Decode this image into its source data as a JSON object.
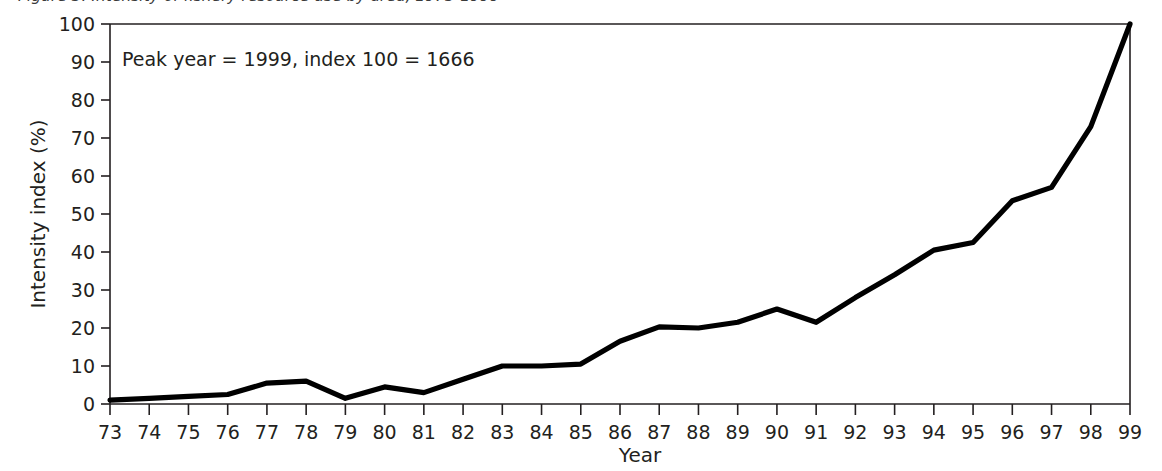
{
  "figure": {
    "caption_fragment": "Figure 3. Intensity of fishery resource use by area, 1973-1999",
    "background_color": "#ffffff",
    "line_color": "#000000",
    "axis_color": "#231f20"
  },
  "chart_data": {
    "type": "line",
    "title": "",
    "subtitle": "",
    "xlabel": "Year",
    "ylabel": "Intensity index (%)",
    "xlim": [
      73,
      99
    ],
    "ylim": [
      0,
      100
    ],
    "grid": false,
    "legend": "none",
    "annotations": [
      {
        "name": "peak-year-note",
        "text": "Peak year = 1999, index 100 = 1666",
        "x": 74.5,
        "y": 90
      }
    ],
    "x_tick_labels": [
      "73",
      "74",
      "75",
      "76",
      "77",
      "78",
      "79",
      "80",
      "81",
      "82",
      "83",
      "84",
      "85",
      "86",
      "87",
      "88",
      "89",
      "90",
      "91",
      "92",
      "93",
      "94",
      "95",
      "96",
      "97",
      "98",
      "99"
    ],
    "y_tick_labels": [
      "0",
      "10",
      "20",
      "30",
      "40",
      "50",
      "60",
      "70",
      "80",
      "90",
      "100"
    ],
    "y_ticks": [
      0,
      10,
      20,
      30,
      40,
      50,
      60,
      70,
      80,
      90,
      100
    ],
    "series": [
      {
        "name": "Intensity index",
        "x": [
          73,
          74,
          75,
          76,
          77,
          78,
          79,
          80,
          81,
          82,
          83,
          84,
          85,
          86,
          87,
          88,
          89,
          90,
          91,
          92,
          93,
          94,
          95,
          96,
          97,
          98,
          99
        ],
        "values": [
          1,
          1.5,
          2,
          2.5,
          5.5,
          6,
          1.5,
          4.5,
          3,
          6.5,
          10,
          10,
          10.5,
          16.5,
          20.3,
          20,
          21.5,
          25,
          21.5,
          28,
          34,
          40.5,
          42.5,
          53.5,
          57,
          73,
          100
        ]
      }
    ]
  }
}
